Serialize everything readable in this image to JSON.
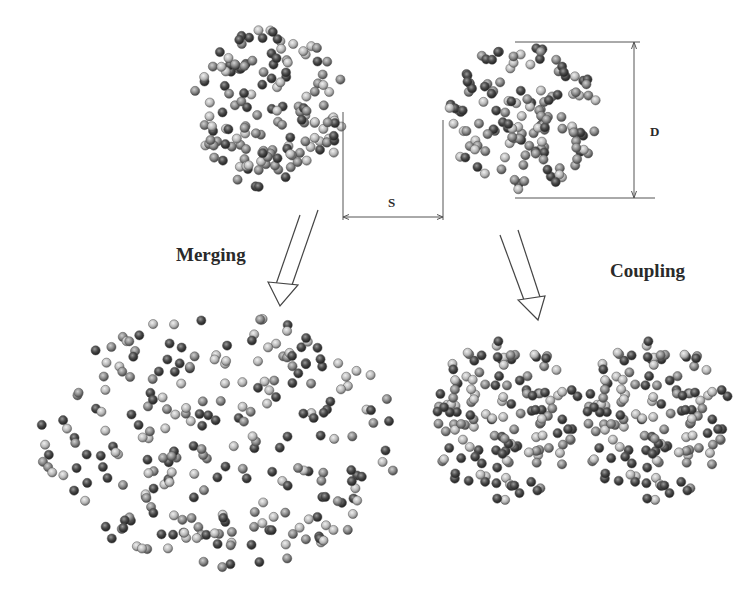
{
  "diagram": {
    "labels": {
      "merging": "Merging",
      "coupling": "Coupling",
      "spacing": "S",
      "diameter": "D"
    },
    "colors": {
      "background": "#ffffff",
      "line": "#555555",
      "particle_light": "#b8b8b8",
      "particle_mid": "#8a8a8a",
      "particle_dark": "#3c3c3c",
      "text": "#2a2a2a"
    },
    "clusters": [
      {
        "id": "initial-left",
        "shape": "circle",
        "cx": 270,
        "cy": 108,
        "rx": 78,
        "ry": 80,
        "count": 150,
        "seed": 11
      },
      {
        "id": "initial-right",
        "shape": "circle",
        "cx": 522,
        "cy": 118,
        "rx": 76,
        "ry": 78,
        "count": 140,
        "seed": 23
      },
      {
        "id": "merged",
        "shape": "ellipse",
        "cx": 218,
        "cy": 442,
        "rx": 180,
        "ry": 128,
        "count": 260,
        "seed": 37
      },
      {
        "id": "coupled-left",
        "shape": "circle",
        "cx": 506,
        "cy": 420,
        "rx": 76,
        "ry": 80,
        "count": 140,
        "seed": 41
      },
      {
        "id": "coupled-right",
        "shape": "circle",
        "cx": 656,
        "cy": 420,
        "rx": 76,
        "ry": 80,
        "count": 140,
        "seed": 41
      }
    ],
    "dimension_s": {
      "x1": 343,
      "x2": 443,
      "y_top_left": 112,
      "y_top_right": 120,
      "y": 217
    },
    "dimension_d": {
      "x": 634,
      "y1": 42,
      "y2": 198,
      "x_start": 515,
      "x_end_top": 640,
      "x_end_bottom": 655
    },
    "arrows": [
      {
        "id": "merging-arrow",
        "lines": [
          [
            318,
            210,
            292,
            285
          ],
          [
            300,
            215,
            274,
            290
          ]
        ],
        "head": [
          [
            268,
            282
          ],
          [
            298,
            285
          ],
          [
            280,
            306
          ]
        ]
      },
      {
        "id": "coupling-arrow",
        "lines": [
          [
            500,
            235,
            524,
            300
          ],
          [
            518,
            230,
            540,
            297
          ]
        ],
        "head": [
          [
            518,
            300
          ],
          [
            545,
            296
          ],
          [
            538,
            320
          ]
        ]
      }
    ]
  }
}
